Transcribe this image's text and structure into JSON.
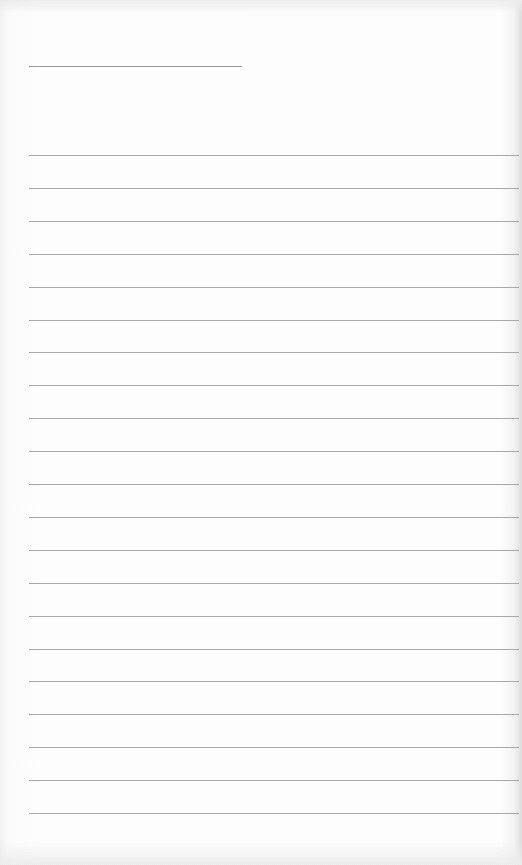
{
  "page": {
    "type": "lined-paper",
    "background_color": "#fdfdfd",
    "line_color": "#a8a8a8"
  },
  "title_line": {
    "text": "",
    "x": 29,
    "y": 66,
    "width": 213
  },
  "ruled_lines": {
    "count": 21,
    "start_y": 155,
    "spacing": 32.9,
    "x": 29,
    "width": 490,
    "entries": [
      "",
      "",
      "",
      "",
      "",
      "",
      "",
      "",
      "",
      "",
      "",
      "",
      "",
      "",
      "",
      "",
      "",
      "",
      "",
      "",
      ""
    ]
  }
}
